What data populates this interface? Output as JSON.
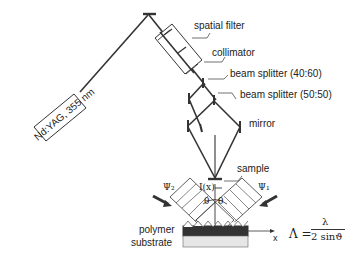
{
  "diagram": {
    "laser_label": "Nd:YAG, 355 nm",
    "components": {
      "spatial_filter": "spatial filter",
      "collimator": "collimator",
      "beam_splitter_1": "beam splitter (40:60)",
      "beam_splitter_2": "beam splitter (50:50)",
      "mirror": "mirror",
      "sample": "sample"
    },
    "inset": {
      "intensity": "I(x)",
      "theta_left": "θ",
      "theta_right": "θ",
      "psi_2": "Ψ₂",
      "psi_1": "Ψ₁",
      "polymer": "polymer",
      "substrate": "substrate",
      "x_axis": "x"
    },
    "formula": {
      "lhs": "Λ =",
      "numerator": "λ",
      "denominator": "2 sinϑ"
    }
  }
}
